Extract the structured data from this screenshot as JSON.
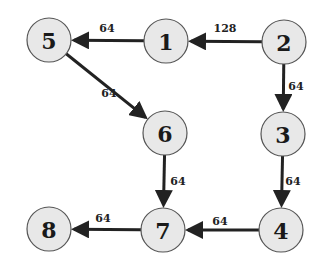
{
  "diagram": {
    "type": "directed-weighted-graph",
    "nodes": [
      {
        "id": "5",
        "label": "5",
        "x": 49,
        "y": 40
      },
      {
        "id": "1",
        "label": "1",
        "x": 166,
        "y": 41
      },
      {
        "id": "2",
        "label": "2",
        "x": 284,
        "y": 42
      },
      {
        "id": "6",
        "label": "6",
        "x": 165,
        "y": 133
      },
      {
        "id": "3",
        "label": "3",
        "x": 283,
        "y": 134
      },
      {
        "id": "8",
        "label": "8",
        "x": 49,
        "y": 229
      },
      {
        "id": "7",
        "label": "7",
        "x": 163,
        "y": 230
      },
      {
        "id": "4",
        "label": "4",
        "x": 281,
        "y": 230
      }
    ],
    "edges": [
      {
        "from": "2",
        "to": "1",
        "weight": "128",
        "lx": 225,
        "ly": 32
      },
      {
        "from": "1",
        "to": "5",
        "weight": "64",
        "lx": 107,
        "ly": 32
      },
      {
        "from": "5",
        "to": "6",
        "weight": "64",
        "lx": 109,
        "ly": 97
      },
      {
        "from": "2",
        "to": "3",
        "weight": "64",
        "lx": 296,
        "ly": 90
      },
      {
        "from": "6",
        "to": "7",
        "weight": "64",
        "lx": 178,
        "ly": 185
      },
      {
        "from": "3",
        "to": "4",
        "weight": "64",
        "lx": 293,
        "ly": 185
      },
      {
        "from": "4",
        "to": "7",
        "weight": "64",
        "lx": 220,
        "ly": 225
      },
      {
        "from": "7",
        "to": "8",
        "weight": "64",
        "lx": 103,
        "ly": 222
      }
    ],
    "node_radius": 22
  }
}
